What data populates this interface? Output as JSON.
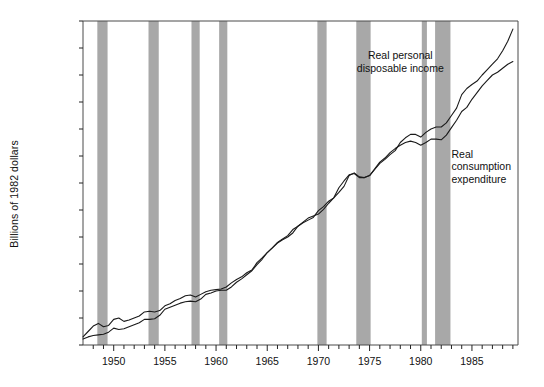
{
  "chart_data": {
    "type": "line",
    "title": "",
    "xlabel": "",
    "ylabel": "Billions of 1982 dollars",
    "xlim": [
      1947.0,
      1989.5
    ],
    "ylim": [
      600,
      3000
    ],
    "grid": false,
    "legend_position": "inline-annotations",
    "y_ticks": [
      "600",
      "800",
      "1,000",
      "1,200",
      "1,400",
      "1,600",
      "1,800",
      "2,000",
      "2,200",
      "2,400",
      "2,600",
      "2,800",
      "3,000"
    ],
    "y_tick_values": [
      600,
      800,
      1000,
      1200,
      1400,
      1600,
      1800,
      2000,
      2200,
      2400,
      2600,
      2800,
      3000
    ],
    "x_ticks": [
      "1950",
      "1955",
      "1960",
      "1965",
      "1970",
      "1975",
      "1980",
      "1985"
    ],
    "x_tick_values": [
      1950,
      1955,
      1960,
      1965,
      1970,
      1975,
      1980,
      1985
    ],
    "x_minor_tick_step": 1,
    "annotations": [
      {
        "text": "Real personal\ndisposable income",
        "x": 1978.0,
        "y": 2790
      },
      {
        "text": "Real\nconsumption\nexpenditure",
        "x": 1983.0,
        "y": 2060
      }
    ],
    "shaded_bands_label": "Recession periods (shaded)",
    "shaded_band_color": "#a8a8a8",
    "line_color": "#1a1a1a",
    "shaded_bands": [
      {
        "start": 1948.4,
        "end": 1949.4
      },
      {
        "start": 1953.4,
        "end": 1954.4
      },
      {
        "start": 1957.6,
        "end": 1958.4
      },
      {
        "start": 1960.3,
        "end": 1961.1
      },
      {
        "start": 1969.9,
        "end": 1970.8
      },
      {
        "start": 1973.7,
        "end": 1975.1
      },
      {
        "start": 1980.1,
        "end": 1980.6
      },
      {
        "start": 1981.4,
        "end": 1982.9
      }
    ],
    "series": [
      {
        "name": "Real personal disposable income",
        "x": [
          1947.0,
          1947.5,
          1948.0,
          1948.5,
          1949.0,
          1949.5,
          1950.0,
          1950.5,
          1951.0,
          1951.5,
          1952.0,
          1952.5,
          1953.0,
          1953.5,
          1954.0,
          1954.5,
          1955.0,
          1955.5,
          1956.0,
          1956.5,
          1957.0,
          1957.5,
          1958.0,
          1958.5,
          1959.0,
          1959.5,
          1960.0,
          1960.5,
          1961.0,
          1961.5,
          1962.0,
          1962.5,
          1963.0,
          1963.5,
          1964.0,
          1964.5,
          1965.0,
          1965.5,
          1966.0,
          1966.5,
          1967.0,
          1967.5,
          1968.0,
          1968.5,
          1969.0,
          1969.5,
          1970.0,
          1970.5,
          1971.0,
          1971.5,
          1972.0,
          1972.5,
          1973.0,
          1973.5,
          1974.0,
          1974.5,
          1975.0,
          1975.5,
          1976.0,
          1976.5,
          1977.0,
          1977.5,
          1978.0,
          1978.5,
          1979.0,
          1979.5,
          1980.0,
          1980.5,
          1981.0,
          1981.5,
          1982.0,
          1982.5,
          1983.0,
          1983.5,
          1984.0,
          1984.5,
          1985.0,
          1985.5,
          1986.0,
          1986.5,
          1987.0,
          1987.5,
          1988.0,
          1988.5,
          1989.0
        ],
        "y": [
          660,
          700,
          740,
          760,
          735,
          745,
          790,
          800,
          775,
          785,
          800,
          815,
          845,
          850,
          845,
          855,
          890,
          905,
          930,
          945,
          965,
          970,
          955,
          975,
          995,
          1005,
          1010,
          1015,
          1030,
          1060,
          1085,
          1105,
          1135,
          1155,
          1210,
          1245,
          1285,
          1320,
          1360,
          1385,
          1410,
          1455,
          1480,
          1505,
          1525,
          1545,
          1595,
          1625,
          1665,
          1690,
          1730,
          1775,
          1855,
          1875,
          1845,
          1840,
          1855,
          1900,
          1945,
          1975,
          2010,
          2040,
          2100,
          2135,
          2160,
          2160,
          2140,
          2175,
          2200,
          2215,
          2215,
          2245,
          2300,
          2355,
          2455,
          2500,
          2530,
          2555,
          2600,
          2640,
          2680,
          2720,
          2780,
          2850,
          2940
        ]
      },
      {
        "name": "Real consumption expenditure",
        "x": [
          1947.0,
          1947.5,
          1948.0,
          1948.5,
          1949.0,
          1949.5,
          1950.0,
          1950.5,
          1951.0,
          1951.5,
          1952.0,
          1952.5,
          1953.0,
          1953.5,
          1954.0,
          1954.5,
          1955.0,
          1955.5,
          1956.0,
          1956.5,
          1957.0,
          1957.5,
          1958.0,
          1958.5,
          1959.0,
          1959.5,
          1960.0,
          1960.5,
          1961.0,
          1961.5,
          1962.0,
          1962.5,
          1963.0,
          1963.5,
          1964.0,
          1964.5,
          1965.0,
          1965.5,
          1966.0,
          1966.5,
          1967.0,
          1967.5,
          1968.0,
          1968.5,
          1969.0,
          1969.5,
          1970.0,
          1970.5,
          1971.0,
          1971.5,
          1972.0,
          1972.5,
          1973.0,
          1973.5,
          1974.0,
          1974.5,
          1975.0,
          1975.5,
          1976.0,
          1976.5,
          1977.0,
          1977.5,
          1978.0,
          1978.5,
          1979.0,
          1979.5,
          1980.0,
          1980.5,
          1981.0,
          1981.5,
          1982.0,
          1982.5,
          1983.0,
          1983.5,
          1984.0,
          1984.5,
          1985.0,
          1985.5,
          1986.0,
          1986.5,
          1987.0,
          1987.5,
          1988.0,
          1988.5,
          1989.0
        ],
        "y": [
          645,
          660,
          670,
          675,
          680,
          695,
          725,
          715,
          720,
          735,
          750,
          765,
          790,
          790,
          795,
          820,
          865,
          880,
          895,
          910,
          920,
          925,
          920,
          940,
          975,
          985,
          1000,
          1005,
          1005,
          1030,
          1065,
          1090,
          1120,
          1150,
          1195,
          1235,
          1285,
          1320,
          1355,
          1380,
          1400,
          1430,
          1480,
          1510,
          1540,
          1555,
          1570,
          1605,
          1650,
          1690,
          1765,
          1815,
          1860,
          1870,
          1840,
          1840,
          1855,
          1905,
          1955,
          1985,
          2025,
          2055,
          2080,
          2100,
          2110,
          2100,
          2080,
          2100,
          2125,
          2125,
          2120,
          2155,
          2210,
          2265,
          2330,
          2360,
          2420,
          2470,
          2520,
          2560,
          2600,
          2620,
          2650,
          2680,
          2700
        ]
      }
    ]
  }
}
